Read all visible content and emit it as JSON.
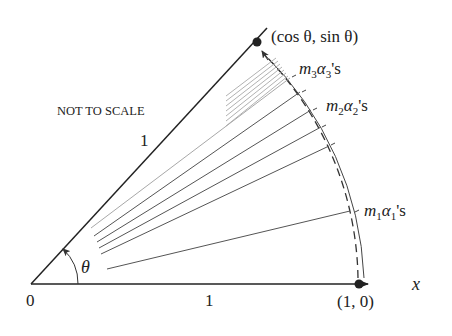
{
  "diagram": {
    "note": "NOT TO SCALE",
    "origin_label": "0",
    "x_axis_label": "x",
    "x_unit_label": "1",
    "radius_label": "1",
    "angle_label": "θ",
    "point_unit": "(1, 0)",
    "point_unit_circle": "(cos θ, sin θ)",
    "tick_labels": [
      {
        "m": "m",
        "sub_m": "1",
        "a": "α",
        "sub_a": "1",
        "suffix": "'s"
      },
      {
        "m": "m",
        "sub_m": "2",
        "a": "α",
        "sub_a": "2",
        "suffix": "'s"
      },
      {
        "m": "m",
        "sub_m": "3",
        "a": "α",
        "sub_a": "3",
        "suffix": "'s"
      }
    ],
    "colors": {
      "line": "#222222",
      "ray_dark": "#555555",
      "ray_light": "#a8a8a8"
    }
  }
}
